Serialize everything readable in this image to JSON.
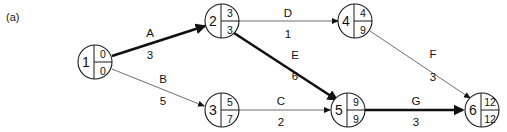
{
  "figure": {
    "panel_label": "(a)"
  },
  "chart_data": {
    "type": "diagram",
    "diagram_kind": "activity-on-arrow-network",
    "title": "(a)",
    "legend_position": "none",
    "grid": false,
    "node_format": "circle split into id (left), early time (top right), late time (bottom right)",
    "critical_path_nodes": [
      "1",
      "2",
      "5",
      "6"
    ],
    "critical_path_activities": [
      "A",
      "E",
      "G"
    ],
    "project_duration": 12,
    "nodes": [
      {
        "id": "1",
        "early": "0",
        "late": "0",
        "x": 95,
        "y": 62,
        "r": 17,
        "critical": true
      },
      {
        "id": "2",
        "early": "3",
        "late": "3",
        "x": 222,
        "y": 21,
        "r": 17,
        "critical": true
      },
      {
        "id": "3",
        "early": "5",
        "late": "7",
        "x": 222,
        "y": 110,
        "r": 17,
        "critical": false
      },
      {
        "id": "4",
        "early": "4",
        "late": "9",
        "x": 355,
        "y": 21,
        "r": 17,
        "critical": false
      },
      {
        "id": "5",
        "early": "9",
        "late": "9",
        "x": 348,
        "y": 110,
        "r": 17,
        "critical": true
      },
      {
        "id": "6",
        "early": "12",
        "late": "12",
        "x": 482,
        "y": 110,
        "r": 17,
        "critical": true
      }
    ],
    "edges": [
      {
        "name": "A",
        "duration": "3",
        "from": "1",
        "to": "2",
        "critical": true,
        "x1": 112,
        "y1": 56,
        "x2": 205,
        "y2": 26,
        "lx": 150,
        "ly": 33,
        "dx": 150,
        "dy": 55
      },
      {
        "name": "B",
        "duration": "5",
        "from": "1",
        "to": "3",
        "critical": false,
        "x1": 112,
        "y1": 69,
        "x2": 204,
        "y2": 106,
        "lx": 163,
        "ly": 79,
        "dx": 163,
        "dy": 101
      },
      {
        "name": "D",
        "duration": "1",
        "from": "2",
        "to": "4",
        "critical": false,
        "x1": 239,
        "y1": 21,
        "x2": 338,
        "y2": 21,
        "lx": 288,
        "ly": 13,
        "dx": 288,
        "dy": 34
      },
      {
        "name": "E",
        "duration": "6",
        "from": "2",
        "to": "5",
        "critical": true,
        "x1": 234,
        "y1": 33,
        "x2": 337,
        "y2": 100,
        "lx": 295,
        "ly": 55,
        "dx": 295,
        "dy": 76
      },
      {
        "name": "C",
        "duration": "2",
        "from": "3",
        "to": "5",
        "critical": false,
        "x1": 239,
        "y1": 110,
        "x2": 330,
        "y2": 110,
        "lx": 281,
        "ly": 101,
        "dx": 281,
        "dy": 122
      },
      {
        "name": "F",
        "duration": "3",
        "from": "4",
        "to": "6",
        "critical": false,
        "x1": 370,
        "y1": 31,
        "x2": 470,
        "y2": 98,
        "lx": 433,
        "ly": 54,
        "dx": 433,
        "dy": 77
      },
      {
        "name": "G",
        "duration": "3",
        "from": "5",
        "to": "6",
        "critical": true,
        "x1": 365,
        "y1": 110,
        "x2": 463,
        "y2": 110,
        "lx": 416,
        "ly": 101,
        "dx": 416,
        "dy": 122
      }
    ]
  }
}
